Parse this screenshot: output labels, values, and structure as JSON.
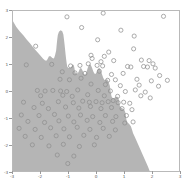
{
  "figure": {
    "width": 191,
    "height": 185,
    "background_color": "#ffffff",
    "frame_color": "#b9b9b9"
  },
  "chart_data": {
    "type": "scatter",
    "title": "",
    "subtitle": "",
    "xlabel": "",
    "ylabel": "",
    "xlim": [
      -3,
      3
    ],
    "ylim": [
      -3,
      3
    ],
    "grid": false,
    "legend": null,
    "legend_position": "none",
    "xticks": [
      -3,
      -2,
      -1,
      0,
      1,
      2,
      3
    ],
    "yticks": [
      -3,
      -2,
      -1,
      0,
      1,
      2,
      3
    ],
    "xticklabels": [
      "-3",
      "-2",
      "-1",
      "0",
      "1",
      "2",
      "3"
    ],
    "yticklabels": [
      "-3",
      "-2",
      "-1",
      "0",
      "1",
      "2",
      "3"
    ],
    "marker": "open-circle",
    "marker_edge_color": "#8e8e8e",
    "marker_face_color": "none",
    "marker_size": 2.1,
    "decision_region": {
      "description": "shaded classification region filling the lower-left portion of the axes, bounded by an irregular jagged decision boundary running from upper-left to lower-right, with an upward peninsula near x=-1.3",
      "fill_color": "#b5b5b5",
      "background_class_color": "#ffffff",
      "boundary_polygon": [
        [
          -3.0,
          2.62
        ],
        [
          -2.88,
          2.4
        ],
        [
          -2.76,
          2.24
        ],
        [
          -2.62,
          2.08
        ],
        [
          -2.5,
          1.92
        ],
        [
          -2.38,
          1.78
        ],
        [
          -2.26,
          1.62
        ],
        [
          -2.14,
          1.48
        ],
        [
          -2.02,
          1.34
        ],
        [
          -1.92,
          1.22
        ],
        [
          -1.84,
          1.14
        ],
        [
          -1.78,
          1.14
        ],
        [
          -1.74,
          1.22
        ],
        [
          -1.7,
          1.3
        ],
        [
          -1.64,
          1.3
        ],
        [
          -1.58,
          1.24
        ],
        [
          -1.52,
          1.22
        ],
        [
          -1.48,
          1.34
        ],
        [
          -1.44,
          1.52
        ],
        [
          -1.42,
          1.74
        ],
        [
          -1.4,
          1.94
        ],
        [
          -1.38,
          2.1
        ],
        [
          -1.34,
          2.22
        ],
        [
          -1.28,
          2.28
        ],
        [
          -1.22,
          2.24
        ],
        [
          -1.18,
          2.12
        ],
        [
          -1.16,
          1.96
        ],
        [
          -1.14,
          1.78
        ],
        [
          -1.12,
          1.58
        ],
        [
          -1.1,
          1.38
        ],
        [
          -1.08,
          1.2
        ],
        [
          -1.06,
          1.04
        ],
        [
          -1.04,
          0.92
        ],
        [
          -1.0,
          0.86
        ],
        [
          -0.94,
          0.86
        ],
        [
          -0.88,
          0.92
        ],
        [
          -0.84,
          1.0
        ],
        [
          -0.8,
          0.96
        ],
        [
          -0.78,
          0.86
        ],
        [
          -0.76,
          0.74
        ],
        [
          -0.72,
          0.66
        ],
        [
          -0.66,
          0.66
        ],
        [
          -0.62,
          0.74
        ],
        [
          -0.58,
          0.84
        ],
        [
          -0.54,
          0.86
        ],
        [
          -0.5,
          0.8
        ],
        [
          -0.46,
          0.7
        ],
        [
          -0.42,
          0.62
        ],
        [
          -0.38,
          0.62
        ],
        [
          -0.34,
          0.72
        ],
        [
          -0.3,
          0.86
        ],
        [
          -0.26,
          0.96
        ],
        [
          -0.22,
          1.0
        ],
        [
          -0.18,
          0.96
        ],
        [
          -0.14,
          0.86
        ],
        [
          -0.1,
          0.74
        ],
        [
          -0.06,
          0.66
        ],
        [
          -0.02,
          0.64
        ],
        [
          0.02,
          0.7
        ],
        [
          0.06,
          0.8
        ],
        [
          0.1,
          0.86
        ],
        [
          0.14,
          0.84
        ],
        [
          0.18,
          0.74
        ],
        [
          0.22,
          0.62
        ],
        [
          0.26,
          0.5
        ],
        [
          0.3,
          0.42
        ],
        [
          0.34,
          0.4
        ],
        [
          0.38,
          0.44
        ],
        [
          0.42,
          0.42
        ],
        [
          0.46,
          0.32
        ],
        [
          0.5,
          0.2
        ],
        [
          0.52,
          0.06
        ],
        [
          0.54,
          -0.08
        ],
        [
          0.56,
          -0.2
        ],
        [
          0.6,
          -0.26
        ],
        [
          0.66,
          -0.26
        ],
        [
          0.72,
          -0.22
        ],
        [
          0.78,
          -0.22
        ],
        [
          0.82,
          -0.3
        ],
        [
          0.84,
          -0.42
        ],
        [
          0.86,
          -0.54
        ],
        [
          0.9,
          -0.62
        ],
        [
          0.96,
          -0.66
        ],
        [
          1.02,
          -0.7
        ],
        [
          1.06,
          -0.8
        ],
        [
          1.08,
          -0.94
        ],
        [
          1.1,
          -1.08
        ],
        [
          1.14,
          -1.18
        ],
        [
          1.2,
          -1.24
        ],
        [
          1.26,
          -1.32
        ],
        [
          1.3,
          -1.44
        ],
        [
          1.34,
          -1.58
        ],
        [
          1.4,
          -1.72
        ],
        [
          1.46,
          -1.86
        ],
        [
          1.52,
          -2.0
        ],
        [
          1.58,
          -2.14
        ],
        [
          1.64,
          -2.28
        ],
        [
          1.7,
          -2.42
        ],
        [
          1.76,
          -2.56
        ],
        [
          1.82,
          -2.7
        ],
        [
          1.88,
          -2.84
        ],
        [
          1.94,
          -3.0
        ],
        [
          -3.0,
          -3.0
        ]
      ]
    },
    "points": [
      [
        -1.05,
        2.78
      ],
      [
        0.26,
        2.92
      ],
      [
        2.44,
        2.8
      ],
      [
        -0.52,
        2.38
      ],
      [
        0.9,
        2.28
      ],
      [
        1.38,
        2.06
      ],
      [
        0.06,
        1.92
      ],
      [
        1.36,
        1.58
      ],
      [
        -2.18,
        1.68
      ],
      [
        -0.18,
        1.34
      ],
      [
        0.3,
        1.3
      ],
      [
        0.46,
        1.46
      ],
      [
        -0.14,
        1.22
      ],
      [
        0.18,
        1.1
      ],
      [
        0.64,
        1.14
      ],
      [
        1.64,
        1.16
      ],
      [
        1.92,
        1.14
      ],
      [
        2.06,
        1.02
      ],
      [
        -2.52,
        0.98
      ],
      [
        -1.6,
        1.0
      ],
      [
        -0.92,
        0.94
      ],
      [
        -0.58,
        0.96
      ],
      [
        -0.28,
        1.02
      ],
      [
        0.04,
        0.96
      ],
      [
        0.24,
        0.94
      ],
      [
        1.14,
        0.92
      ],
      [
        1.26,
        0.9
      ],
      [
        1.72,
        0.92
      ],
      [
        1.86,
        0.9
      ],
      [
        2.14,
        0.86
      ],
      [
        -1.22,
        0.72
      ],
      [
        -0.76,
        0.68
      ],
      [
        -0.4,
        0.66
      ],
      [
        0.12,
        0.74
      ],
      [
        0.56,
        0.62
      ],
      [
        0.98,
        0.66
      ],
      [
        2.3,
        0.58
      ],
      [
        -1.3,
        0.44
      ],
      [
        -0.96,
        0.42
      ],
      [
        -0.54,
        0.48
      ],
      [
        0.42,
        0.4
      ],
      [
        0.7,
        0.42
      ],
      [
        1.48,
        0.44
      ],
      [
        2.0,
        0.38
      ],
      [
        2.58,
        0.4
      ],
      [
        -0.18,
        0.26
      ],
      [
        0.34,
        0.24
      ],
      [
        0.88,
        0.2
      ],
      [
        1.56,
        0.22
      ],
      [
        2.26,
        0.18
      ],
      [
        -2.12,
        0.02
      ],
      [
        -1.84,
        0.0
      ],
      [
        -1.56,
        0.02
      ],
      [
        -1.28,
        0.0
      ],
      [
        -1.06,
        -0.02
      ],
      [
        -0.66,
        0.04
      ],
      [
        0.08,
        0.02
      ],
      [
        0.52,
        0.0
      ],
      [
        1.06,
        -0.02
      ],
      [
        1.42,
        0.04
      ],
      [
        1.78,
        -0.04
      ],
      [
        -2.0,
        -0.18
      ],
      [
        -1.2,
        -0.16
      ],
      [
        -0.86,
        -0.2
      ],
      [
        -0.3,
        -0.14
      ],
      [
        0.3,
        -0.18
      ],
      [
        0.78,
        -0.2
      ],
      [
        1.62,
        -0.18
      ],
      [
        1.96,
        -0.26
      ],
      [
        -2.62,
        -0.42
      ],
      [
        -1.94,
        -0.46
      ],
      [
        -1.36,
        -0.4
      ],
      [
        -0.82,
        -0.44
      ],
      [
        -0.48,
        -0.38
      ],
      [
        -0.24,
        -0.42
      ],
      [
        0.0,
        -0.4
      ],
      [
        0.22,
        -0.44
      ],
      [
        0.44,
        -0.4
      ],
      [
        0.62,
        -0.36
      ],
      [
        0.8,
        -0.44
      ],
      [
        1.0,
        -0.42
      ],
      [
        1.22,
        -0.46
      ],
      [
        -2.24,
        -0.62
      ],
      [
        -1.72,
        -0.66
      ],
      [
        -1.1,
        -0.6
      ],
      [
        -0.62,
        -0.64
      ],
      [
        -0.2,
        -0.58
      ],
      [
        0.18,
        -0.66
      ],
      [
        0.56,
        -0.62
      ],
      [
        0.94,
        -0.66
      ],
      [
        1.3,
        -0.7
      ],
      [
        -2.7,
        -0.9
      ],
      [
        -2.06,
        -0.92
      ],
      [
        -1.5,
        -0.88
      ],
      [
        -1.0,
        -0.94
      ],
      [
        -0.56,
        -0.9
      ],
      [
        -0.12,
        -0.96
      ],
      [
        0.34,
        -0.92
      ],
      [
        0.72,
        -0.96
      ],
      [
        1.1,
        -0.92
      ],
      [
        -2.46,
        -1.14
      ],
      [
        -1.86,
        -1.18
      ],
      [
        -1.34,
        -1.12
      ],
      [
        -0.8,
        -1.16
      ],
      [
        -0.32,
        -1.1
      ],
      [
        0.14,
        -1.18
      ],
      [
        0.6,
        -1.14
      ],
      [
        1.04,
        -1.2
      ],
      [
        1.34,
        -1.16
      ],
      [
        -2.78,
        -1.4
      ],
      [
        -2.2,
        -1.44
      ],
      [
        -1.64,
        -1.38
      ],
      [
        -1.16,
        -1.42
      ],
      [
        -0.68,
        -1.36
      ],
      [
        -0.22,
        -1.44
      ],
      [
        0.26,
        -1.4
      ],
      [
        0.7,
        -1.46
      ],
      [
        -2.56,
        -1.7
      ],
      [
        -1.98,
        -1.74
      ],
      [
        -1.44,
        -1.68
      ],
      [
        -0.96,
        -1.72
      ],
      [
        -0.44,
        -1.66
      ],
      [
        0.02,
        -1.74
      ],
      [
        0.48,
        -1.7
      ],
      [
        -2.3,
        -2.02
      ],
      [
        -1.7,
        -2.06
      ],
      [
        -1.18,
        -2.0
      ],
      [
        -0.6,
        -2.08
      ],
      [
        -0.06,
        -2.02
      ],
      [
        -1.4,
        -2.4
      ],
      [
        -0.8,
        -2.44
      ],
      [
        -1.02,
        -2.72
      ]
    ]
  }
}
